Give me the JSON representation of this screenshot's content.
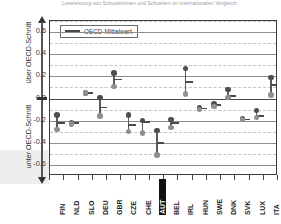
{
  "title": "Leseleistung von Schuelerinnen und Schuelern im internationalen Vergleich",
  "axis": {
    "y_label_upper": "über OECD-Schnitt",
    "y_label_lower": "unter OECD-Schnitt",
    "y_ticks": [
      "0.6",
      "0.4",
      "0.2",
      "0.0",
      "-0.2",
      "-0.4",
      "-0.6"
    ]
  },
  "legend": {
    "mean_label": "OECD-Mittelwert"
  },
  "colors": {
    "dark_marker": "#4e4e4e",
    "light_marker": "#909090",
    "mean_line": "#4a4a4a",
    "grid_major": "#8d8d8d",
    "grid_minor": "#c4c4c4",
    "highlight_bg": "#111111",
    "highlight_fg": "#ffffff"
  },
  "chart_data": {
    "type": "scatter",
    "title": "Leseleistung von Schuelerinnen und Schuelern im internationalen Vergleich",
    "xlabel": "",
    "ylabel": "über OECD-Schnitt / unter OECD-Schnitt",
    "ylim": [
      -0.7,
      0.7
    ],
    "yticks": [
      0.6,
      0.4,
      0.2,
      0.0,
      -0.2,
      -0.4,
      -0.6
    ],
    "grid": "major solid at 0.2 steps, minor dashed at 0.1 steps",
    "legend_position": "top-left inside plot",
    "categories": [
      "FIN",
      "NLD",
      "SLO",
      "DEU",
      "GBR",
      "CZE",
      "CHE",
      "AUT",
      "BEL",
      "IRL",
      "HUN",
      "SWE",
      "DNK",
      "SVK",
      "LUX",
      "ITA"
    ],
    "highlighted_category": "AUT",
    "series": [
      {
        "name": "oberer Wert",
        "values": [
          -0.15,
          -0.22,
          0.05,
          0.01,
          0.23,
          -0.15,
          -0.2,
          -0.29,
          -0.19,
          0.27,
          -0.08,
          -0.05,
          0.08,
          -0.18,
          -0.11,
          0.19
        ]
      },
      {
        "name": "unterer Wert",
        "values": [
          -0.28,
          -0.23,
          0.05,
          -0.16,
          0.11,
          -0.3,
          -0.31,
          -0.51,
          -0.26,
          0.04,
          -0.1,
          -0.07,
          0.01,
          -0.19,
          -0.17,
          0.03
        ]
      },
      {
        "name": "OECD-Mittelwert",
        "values": [
          -0.22,
          -0.22,
          0.05,
          -0.08,
          0.17,
          -0.24,
          -0.21,
          -0.4,
          -0.22,
          0.15,
          -0.09,
          -0.06,
          0.02,
          -0.19,
          -0.16,
          0.12
        ]
      }
    ]
  }
}
